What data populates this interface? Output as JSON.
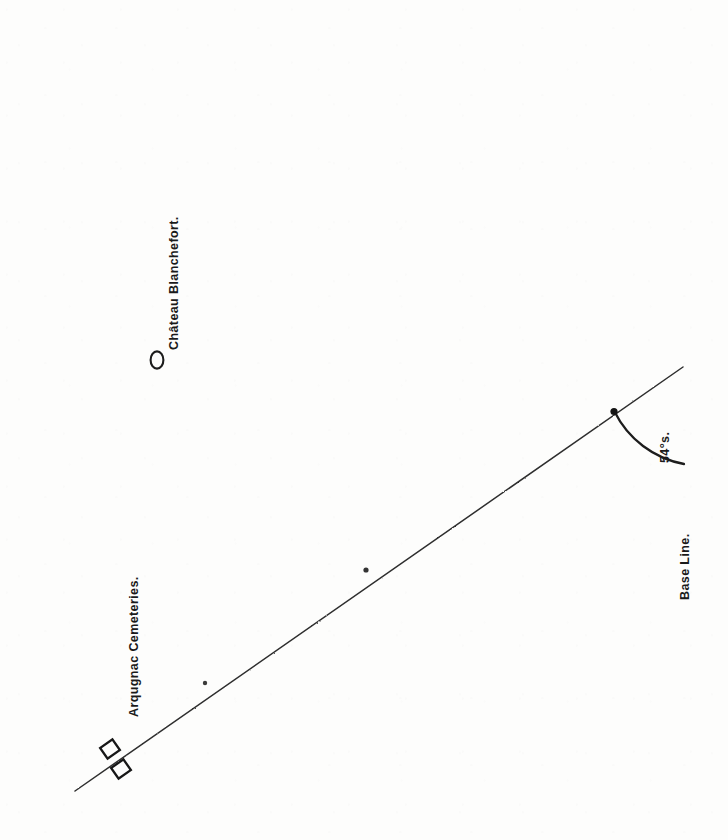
{
  "figure": {
    "type": "survey-diagram",
    "background_color": "#fdfdfc",
    "ink_color": "#1a1a1a",
    "width": 728,
    "height": 840
  },
  "labels": {
    "chateau": "Château Blanchefort.",
    "cemeteries": "Arqugnac Cemeteries.",
    "base_line": "Base Line.",
    "angle": "54°s."
  },
  "geometry": {
    "vertex": {
      "x": 683,
      "y": 367
    },
    "horizontal_line": {
      "x1": 50,
      "y1": 367,
      "x2": 683,
      "y2": 367
    },
    "vertical_base_line": {
      "x1": 684,
      "y1": 40,
      "x2": 684,
      "y2": 786
    },
    "diagonal_bearing_line": {
      "x1": 683,
      "y1": 367,
      "x2": 75,
      "y2": 791
    },
    "angle_arc": {
      "center_x": 683,
      "center_y": 367,
      "radius": 97,
      "start_deg": 90,
      "end_deg": 145
    },
    "angle_value_degrees": 54
  },
  "symbols": {
    "chateau_marker": {
      "name": "circle-marker",
      "cx": 157,
      "cy": 360,
      "rx": 6.5,
      "ry": 8.5
    },
    "cemetery_markers": [
      {
        "name": "rect-marker-upper",
        "cx": 110,
        "cy": 749,
        "w": 15,
        "h": 13
      },
      {
        "name": "rect-marker-lower",
        "cx": 120,
        "cy": 768,
        "w": 15,
        "h": 13
      }
    ],
    "tick_marks": [
      {
        "name": "diagonal-tick-mid",
        "cx": 366,
        "cy": 570
      },
      {
        "name": "diagonal-tick-lower",
        "cx": 205,
        "cy": 682
      },
      {
        "name": "angle-arc-vertex-dot",
        "cx": 614,
        "cy": 412
      }
    ]
  }
}
